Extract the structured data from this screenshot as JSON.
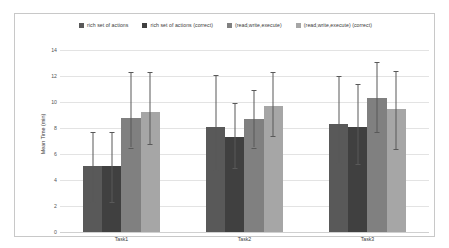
{
  "chart_data": {
    "type": "bar",
    "title": "",
    "xlabel": "",
    "ylabel": "Mean Time (min)",
    "categories": [
      "Task1",
      "Task2",
      "Task3"
    ],
    "ylim": [
      0,
      14
    ],
    "yticks": [
      0,
      2,
      4,
      6,
      8,
      10,
      12,
      14
    ],
    "grid": true,
    "legend_position": "top",
    "orientation": "vertical",
    "series": [
      {
        "name": "rich set of actions",
        "color": "#595959",
        "values": [
          5.1,
          8.1,
          8.3
        ],
        "error_upper": [
          2.6,
          4.0,
          3.7
        ],
        "error_lower": [
          2.8,
          3.3,
          3.0
        ]
      },
      {
        "name": "rich set of actions (correct)",
        "color": "#404040",
        "values": [
          5.1,
          7.3,
          8.1
        ],
        "error_upper": [
          2.6,
          2.6,
          3.3
        ],
        "error_lower": [
          2.8,
          2.4,
          2.9
        ]
      },
      {
        "name": "(read,write,execute)",
        "color": "#808080",
        "values": [
          8.8,
          8.7,
          10.3
        ],
        "error_upper": [
          3.5,
          2.2,
          2.8
        ],
        "error_lower": [
          2.3,
          2.2,
          2.6
        ]
      },
      {
        "name": "(read,write,execute) (correct)",
        "color": "#a6a6a6",
        "values": [
          9.2,
          9.7,
          9.5
        ],
        "error_upper": [
          3.1,
          2.6,
          2.9
        ],
        "error_lower": [
          2.4,
          2.3,
          3.1
        ]
      }
    ]
  },
  "legend": {
    "items": [
      {
        "label": "rich set of actions",
        "color": "#595959",
        "marker": "square-marker"
      },
      {
        "label": "rich set of actions (correct)",
        "color": "#404040",
        "marker": "square-marker"
      },
      {
        "label": "(read,write,execute)",
        "color": "#808080",
        "marker": "square-marker"
      },
      {
        "label": "(read,write,execute) (correct)",
        "color": "#a6a6a6",
        "marker": "square-marker"
      }
    ]
  },
  "axes": {
    "y_label": "Mean Time (min)",
    "y_ticks": [
      "14",
      "12",
      "10",
      "8",
      "6",
      "4",
      "2",
      "0"
    ],
    "x_ticks": [
      "Task1",
      "Task2",
      "Task3"
    ]
  },
  "colors": {
    "background": "#ffffff",
    "frame_border": "#c8c8c8",
    "gridline": "#e3e3e3",
    "error_bar": "#595959",
    "tick_text": "#555555"
  }
}
